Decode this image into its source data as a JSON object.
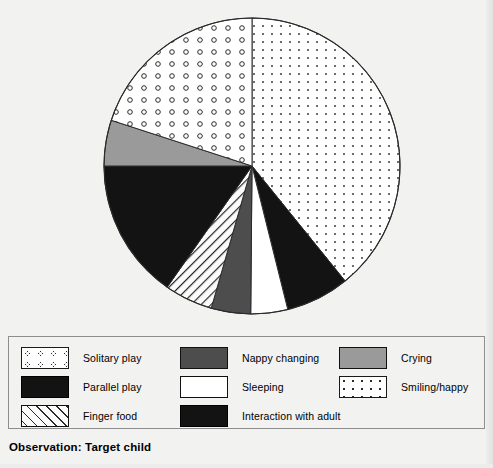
{
  "caption": "Observation: Target child",
  "colors": {
    "black": "#131313",
    "dark_gray": "#4d4d4d",
    "medium_gray": "#9a9a9a",
    "white": "#ffffff",
    "outline": "#2b2b2b",
    "page_background": "#f2f2f0"
  },
  "legend": {
    "columns": [
      {
        "items": [
          {
            "label": "Solitary play",
            "pattern": "circles-open",
            "swatch_class": "sw-circles"
          },
          {
            "label": "Parallel play",
            "pattern": "solid-black",
            "swatch_class": "sw-black"
          },
          {
            "label": "Finger food",
            "pattern": "diagonal-hatch",
            "swatch_class": "sw-hatch"
          }
        ]
      },
      {
        "items": [
          {
            "label": "Nappy changing",
            "pattern": "solid-dark-gray",
            "swatch_class": "sw-darkgray"
          },
          {
            "label": "Sleeping",
            "pattern": "solid-white",
            "swatch_class": "sw-white"
          },
          {
            "label": "Interaction with adult",
            "pattern": "solid-black",
            "swatch_class": "sw-black"
          }
        ]
      },
      {
        "items": [
          {
            "label": "Crying",
            "pattern": "solid-medium-gray",
            "swatch_class": "sw-gray"
          },
          {
            "label": "Smiling/happy",
            "pattern": "fine-dots",
            "swatch_class": "sw-dots"
          }
        ]
      }
    ]
  },
  "chart_data": {
    "type": "pie",
    "title": "Observation: Target child",
    "xlabel": "",
    "ylabel": "",
    "legend_position": "bottom",
    "grid": false,
    "start_angle_deg": 0,
    "direction": "clockwise",
    "center": {
      "x": 252,
      "y": 166
    },
    "radius": 148,
    "categories": [
      "Smiling/happy",
      "Interaction with adult",
      "Sleeping",
      "Nappy changing",
      "Finger food",
      "Parallel play",
      "Crying",
      "Solitary play"
    ],
    "values": [
      39.2,
      7.0,
      4.0,
      4.3,
      5.3,
      15.3,
      5.0,
      19.9
    ],
    "units": "percent",
    "slices": [
      {
        "label": "Smiling/happy",
        "percent": 39.2,
        "start_deg": 0.0,
        "end_deg": 141.0,
        "pattern": "fine-dots",
        "fill": "#ffffff"
      },
      {
        "label": "Interaction with adult",
        "percent": 7.0,
        "start_deg": 141.0,
        "end_deg": 166.0,
        "pattern": "solid-black",
        "fill": "#131313"
      },
      {
        "label": "Sleeping",
        "percent": 4.0,
        "start_deg": 166.0,
        "end_deg": 180.5,
        "pattern": "solid-white",
        "fill": "#ffffff"
      },
      {
        "label": "Nappy changing",
        "percent": 4.3,
        "start_deg": 180.5,
        "end_deg": 196.0,
        "pattern": "solid-dark-gray",
        "fill": "#4d4d4d"
      },
      {
        "label": "Finger food",
        "percent": 5.3,
        "start_deg": 196.0,
        "end_deg": 215.0,
        "pattern": "diagonal-hatch",
        "fill": "#fbfbfb"
      },
      {
        "label": "Parallel play",
        "percent": 15.3,
        "start_deg": 215.0,
        "end_deg": 270.0,
        "pattern": "solid-black",
        "fill": "#131313"
      },
      {
        "label": "Crying",
        "percent": 5.0,
        "start_deg": 270.0,
        "end_deg": 288.0,
        "pattern": "solid-medium-gray",
        "fill": "#9a9a9a"
      },
      {
        "label": "Solitary play",
        "percent": 19.9,
        "start_deg": 288.0,
        "end_deg": 360.0,
        "pattern": "circles-open",
        "fill": "#ffffff"
      }
    ]
  }
}
